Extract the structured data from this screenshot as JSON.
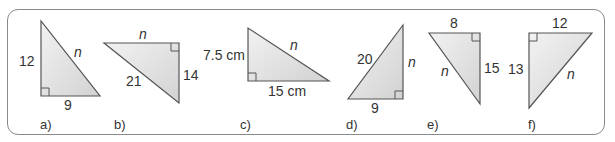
{
  "colors": {
    "frame_border": "#8a8a8a",
    "triangle_stroke": "#555555",
    "triangle_fill_light": "#f2f2f2",
    "triangle_fill_dark": "#d4d4d4",
    "text": "#333333"
  },
  "triangles": [
    {
      "caption": "a)",
      "labels": {
        "vertical": "12",
        "horizontal": "9",
        "hypotenuse": "n"
      }
    },
    {
      "caption": "b)",
      "labels": {
        "horizontal": "n",
        "vertical": "14",
        "hypotenuse": "21"
      }
    },
    {
      "caption": "c)",
      "labels": {
        "vertical": "7.5 cm",
        "horizontal": "15 cm",
        "hypotenuse": "n"
      }
    },
    {
      "caption": "d)",
      "labels": {
        "hypotenuse": "20",
        "vertical": "n",
        "horizontal": "9"
      }
    },
    {
      "caption": "e)",
      "labels": {
        "horizontal": "8",
        "vertical": "15",
        "hypotenuse": "n"
      }
    },
    {
      "caption": "f)",
      "labels": {
        "horizontal": "12",
        "vertical": "13",
        "hypotenuse": "n"
      }
    }
  ]
}
